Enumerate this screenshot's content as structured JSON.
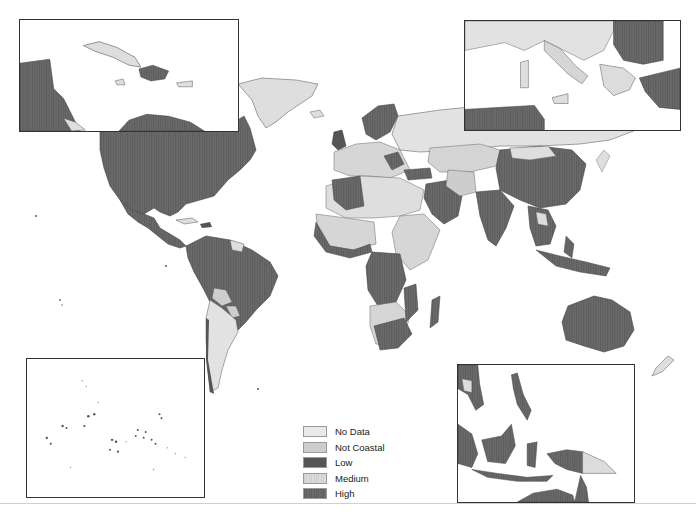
{
  "map": {
    "title": "",
    "legend": {
      "items": [
        {
          "label": "No Data",
          "color": "#e9e9e9",
          "pattern": "none"
        },
        {
          "label": "Not Coastal",
          "color": "#cdcdcd",
          "pattern": "none"
        },
        {
          "label": "Low",
          "color": "#555555",
          "pattern": "none"
        },
        {
          "label": "Medium",
          "color": "#d9d9d9",
          "pattern": "vertical-hatch"
        },
        {
          "label": "High",
          "color": "#6b6b6b",
          "pattern": "vertical-hatch"
        }
      ]
    },
    "insets": [
      {
        "name": "Caribbean & Central America",
        "position": "top-left"
      },
      {
        "name": "Mediterranean & Balkans",
        "position": "top-right"
      },
      {
        "name": "Pacific Islands",
        "position": "bottom-left"
      },
      {
        "name": "Southeast Asia & Indonesia",
        "position": "bottom-right"
      }
    ]
  }
}
